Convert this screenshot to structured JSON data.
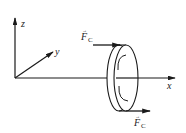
{
  "diagram": {
    "type": "mechanics-free-body",
    "axes": {
      "x": {
        "label": "x"
      },
      "y": {
        "label": "y"
      },
      "z": {
        "label": "z"
      }
    },
    "forces": {
      "top": {
        "symbol": "F",
        "subscript": "C",
        "vector_mark": "→",
        "direction": "+x"
      },
      "bottom": {
        "symbol": "F",
        "subscript": "C",
        "vector_mark": "→",
        "direction": "+x"
      }
    },
    "body": {
      "shape": "disc",
      "rotation_indicator": "curved-arcs"
    },
    "colors": {
      "stroke": "#1a1a1a",
      "background": "#ffffff"
    }
  }
}
